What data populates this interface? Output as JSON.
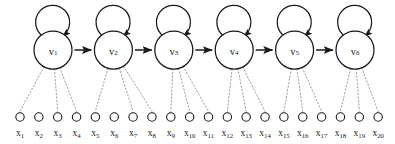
{
  "figure": {
    "background_color": "#ffffff",
    "stroke_color": "#1a1a1a",
    "emission_color": "#8c8c8c",
    "width": 395,
    "height": 144
  },
  "layout": {
    "state_row_y": 50,
    "state_radius": 19,
    "state_first_cx": 53,
    "state_spacing": 60.4,
    "self_loop_radius": 17,
    "self_loop_cy": 22,
    "obs_row_y": 117,
    "obs_radius": 4.2,
    "obs_first_cx": 20,
    "obs_spacing": 18.85,
    "obs_label_y": 136
  },
  "states": [
    {
      "id": "v1",
      "base": "v",
      "subscript": "1",
      "label": "v₁",
      "cx": 53,
      "self_loop": true,
      "outgoing_arrow": true,
      "emits": [
        1,
        3,
        4
      ]
    },
    {
      "id": "v2",
      "base": "v",
      "subscript": "2",
      "label": "v₂",
      "cx": 113.4,
      "self_loop": true,
      "outgoing_arrow": true,
      "emits": [
        5,
        7,
        8
      ]
    },
    {
      "id": "v3",
      "base": "v",
      "subscript": "3",
      "label": "v₃",
      "cx": 173.8,
      "self_loop": true,
      "outgoing_arrow": true,
      "emits": [
        9,
        10,
        11
      ]
    },
    {
      "id": "v4",
      "base": "v",
      "subscript": "4",
      "label": "v₄",
      "cx": 234.2,
      "self_loop": true,
      "outgoing_arrow": true,
      "emits": [
        12,
        13,
        14
      ]
    },
    {
      "id": "v5",
      "base": "v",
      "subscript": "5",
      "label": "v₅",
      "cx": 294.6,
      "self_loop": true,
      "outgoing_arrow": true,
      "emits": [
        15,
        16,
        17
      ]
    },
    {
      "id": "v6",
      "base": "v",
      "subscript": "6",
      "label": "v₆",
      "cx": 355,
      "self_loop": true,
      "outgoing_arrow": false,
      "emits": [
        18,
        19,
        20
      ]
    }
  ],
  "transitions": [
    {
      "from": "v1",
      "to": "v2",
      "type": "forward-arrow"
    },
    {
      "from": "v2",
      "to": "v3",
      "type": "forward-arrow"
    },
    {
      "from": "v3",
      "to": "v4",
      "type": "forward-arrow"
    },
    {
      "from": "v4",
      "to": "v5",
      "type": "forward-arrow"
    },
    {
      "from": "v5",
      "to": "v6",
      "type": "forward-arrow"
    },
    {
      "from": "v1",
      "to": "v1",
      "type": "self-loop"
    },
    {
      "from": "v2",
      "to": "v2",
      "type": "self-loop"
    },
    {
      "from": "v3",
      "to": "v3",
      "type": "self-loop"
    },
    {
      "from": "v4",
      "to": "v4",
      "type": "self-loop"
    },
    {
      "from": "v5",
      "to": "v5",
      "type": "self-loop"
    },
    {
      "from": "v6",
      "to": "v6",
      "type": "self-loop"
    }
  ],
  "observations": [
    {
      "id": "x1",
      "base": "x",
      "subscript": "1",
      "label": "x₁",
      "index": 1
    },
    {
      "id": "x2",
      "base": "x",
      "subscript": "2",
      "label": "x₂",
      "index": 2
    },
    {
      "id": "x3",
      "base": "x",
      "subscript": "3",
      "label": "x₃",
      "index": 3
    },
    {
      "id": "x4",
      "base": "x",
      "subscript": "4",
      "label": "x₄",
      "index": 4
    },
    {
      "id": "x5",
      "base": "x",
      "subscript": "5",
      "label": "x₅",
      "index": 5
    },
    {
      "id": "x6",
      "base": "x",
      "subscript": "6",
      "label": "x₆",
      "index": 6
    },
    {
      "id": "x7",
      "base": "x",
      "subscript": "7",
      "label": "x₇",
      "index": 7
    },
    {
      "id": "x8",
      "base": "x",
      "subscript": "8",
      "label": "x₈",
      "index": 8
    },
    {
      "id": "x9",
      "base": "x",
      "subscript": "9",
      "label": "x₉",
      "index": 9
    },
    {
      "id": "x10",
      "base": "x",
      "subscript": "10",
      "label": "x₁₀",
      "index": 10
    },
    {
      "id": "x11",
      "base": "x",
      "subscript": "11",
      "label": "x₁₁",
      "index": 11
    },
    {
      "id": "x12",
      "base": "x",
      "subscript": "12",
      "label": "x₁₂",
      "index": 12
    },
    {
      "id": "x13",
      "base": "x",
      "subscript": "13",
      "label": "x₁₃",
      "index": 13
    },
    {
      "id": "x14",
      "base": "x",
      "subscript": "14",
      "label": "x₁₄",
      "index": 14
    },
    {
      "id": "x15",
      "base": "x",
      "subscript": "15",
      "label": "x₁₅",
      "index": 15
    },
    {
      "id": "x16",
      "base": "x",
      "subscript": "16",
      "label": "x₁₆",
      "index": 16
    },
    {
      "id": "x17",
      "base": "x",
      "subscript": "17",
      "label": "x₁₇",
      "index": 17
    },
    {
      "id": "x18",
      "base": "x",
      "subscript": "18",
      "label": "x₁₈",
      "index": 18
    },
    {
      "id": "x19",
      "base": "x",
      "subscript": "19",
      "label": "x₁₉",
      "index": 19
    },
    {
      "id": "x20",
      "base": "x",
      "subscript": "20",
      "label": "x₂₀",
      "index": 20
    }
  ]
}
